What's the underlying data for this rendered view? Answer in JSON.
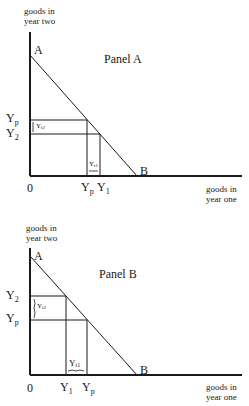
{
  "panels": [
    {
      "title": "Panel A",
      "y_axis_label_line1": "goods in",
      "y_axis_label_line2": "year two",
      "x_axis_label_line1": "goods in",
      "x_axis_label_line2": "year one",
      "point_a": "A",
      "point_b": "B",
      "origin": "0",
      "y_ticks": [
        {
          "base": "Y",
          "sub": "p"
        },
        {
          "base": "Y",
          "sub": "2"
        }
      ],
      "x_ticks": [
        {
          "base": "Y",
          "sub": "p"
        },
        {
          "base": "Y",
          "sub": "1"
        }
      ],
      "bracket_y": {
        "base": "Y",
        "sub": "t2"
      },
      "bracket_x": {
        "base": "Y",
        "sub": "t1"
      }
    },
    {
      "title": "Panel B",
      "y_axis_label_line1": "goods in",
      "y_axis_label_line2": "year two",
      "x_axis_label_line1": "goods in",
      "x_axis_label_line2": "year one",
      "point_a": "A",
      "point_b": "B",
      "origin": "0",
      "y_ticks": [
        {
          "base": "Y",
          "sub": "2"
        },
        {
          "base": "Y",
          "sub": "p"
        }
      ],
      "x_ticks": [
        {
          "base": "Y",
          "sub": "1"
        },
        {
          "base": "Y",
          "sub": "p"
        }
      ],
      "bracket_y": {
        "base": "Y",
        "sub": "t2"
      },
      "bracket_x": {
        "base": "Y",
        "sub": "t1"
      }
    }
  ]
}
